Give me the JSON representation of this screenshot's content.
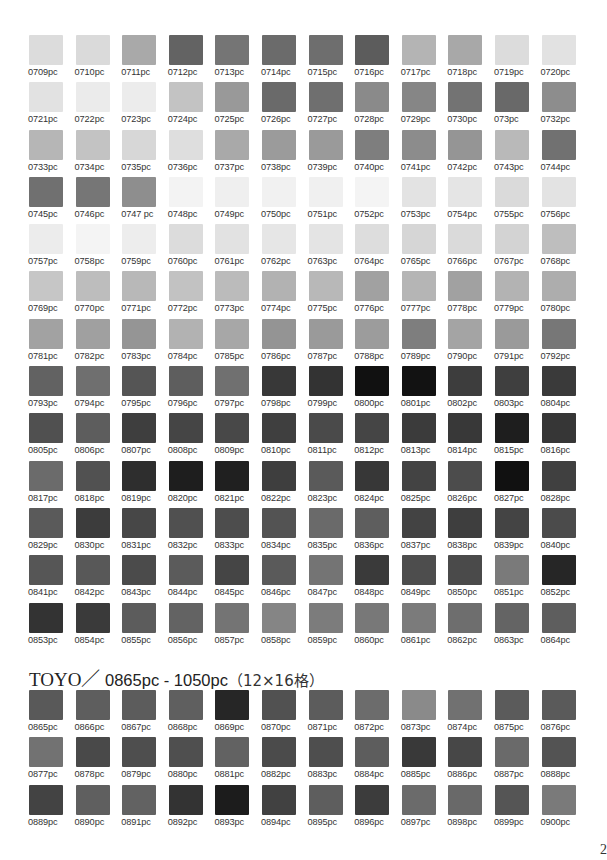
{
  "page": {
    "page_number": "2"
  },
  "section1": {
    "swatches": [
      {
        "code": "0709pc",
        "color": "#dcdcdc"
      },
      {
        "code": "0710pc",
        "color": "#dadada"
      },
      {
        "code": "0711pc",
        "color": "#a9a9a9"
      },
      {
        "code": "0712pc",
        "color": "#636363"
      },
      {
        "code": "0713pc",
        "color": "#757575"
      },
      {
        "code": "0714pc",
        "color": "#6b6b6b"
      },
      {
        "code": "0715pc",
        "color": "#6e6e6e"
      },
      {
        "code": "0716pc",
        "color": "#5c5c5c"
      },
      {
        "code": "0717pc",
        "color": "#b4b4b4"
      },
      {
        "code": "0718pc",
        "color": "#a8a8a8"
      },
      {
        "code": "0719pc",
        "color": "#dcdcdc"
      },
      {
        "code": "0720pc",
        "color": "#e2e2e2"
      },
      {
        "code": "0721pc",
        "color": "#e2e2e2"
      },
      {
        "code": "0722pc",
        "color": "#ebebeb"
      },
      {
        "code": "0723pc",
        "color": "#ececec"
      },
      {
        "code": "0724pc",
        "color": "#c3c3c3"
      },
      {
        "code": "0725pc",
        "color": "#999999"
      },
      {
        "code": "0726pc",
        "color": "#6a6a6a"
      },
      {
        "code": "0727pc",
        "color": "#6f6f6f"
      },
      {
        "code": "0728pc",
        "color": "#8a8a8a"
      },
      {
        "code": "0729pc",
        "color": "#868686"
      },
      {
        "code": "0730pc",
        "color": "#737373"
      },
      {
        "code": "073pc",
        "color": "#696969"
      },
      {
        "code": "0732pc",
        "color": "#8d8d8d"
      },
      {
        "code": "0733pc",
        "color": "#b6b6b6"
      },
      {
        "code": "0734pc",
        "color": "#c3c3c3"
      },
      {
        "code": "0735pc",
        "color": "#d7d7d7"
      },
      {
        "code": "0736pc",
        "color": "#dedede"
      },
      {
        "code": "0737pc",
        "color": "#a9a9a9"
      },
      {
        "code": "0738pc",
        "color": "#9b9b9b"
      },
      {
        "code": "0739pc",
        "color": "#9a9a9a"
      },
      {
        "code": "0740pc",
        "color": "#7e7e7e"
      },
      {
        "code": "0741pc",
        "color": "#8c8c8c"
      },
      {
        "code": "0742pc",
        "color": "#959595"
      },
      {
        "code": "0743pc",
        "color": "#b9b9b9"
      },
      {
        "code": "0744pc",
        "color": "#717171"
      },
      {
        "code": "0745pc",
        "color": "#707070"
      },
      {
        "code": "0746pc",
        "color": "#767676"
      },
      {
        "code": "0747 pc",
        "color": "#8e8e8e"
      },
      {
        "code": "0748pc",
        "color": "#f3f3f3"
      },
      {
        "code": "0749pc",
        "color": "#efefef"
      },
      {
        "code": "0750pc",
        "color": "#f1f1f1"
      },
      {
        "code": "0751pc",
        "color": "#f0f0f0"
      },
      {
        "code": "0752pc",
        "color": "#f4f4f4"
      },
      {
        "code": "0753pc",
        "color": "#e3e3e3"
      },
      {
        "code": "0754pc",
        "color": "#e5e5e5"
      },
      {
        "code": "0755pc",
        "color": "#dadada"
      },
      {
        "code": "0756pc",
        "color": "#e3e3e3"
      },
      {
        "code": "0757pc",
        "color": "#ececec"
      },
      {
        "code": "0758pc",
        "color": "#f4f4f4"
      },
      {
        "code": "0759pc",
        "color": "#ededed"
      },
      {
        "code": "0760pc",
        "color": "#dcdcdc"
      },
      {
        "code": "0761pc",
        "color": "#e2e2e2"
      },
      {
        "code": "0762pc",
        "color": "#e6e6e6"
      },
      {
        "code": "0763pc",
        "color": "#e4e4e4"
      },
      {
        "code": "0764pc",
        "color": "#dddddd"
      },
      {
        "code": "0765pc",
        "color": "#d6d6d6"
      },
      {
        "code": "0766pc",
        "color": "#dadada"
      },
      {
        "code": "0767pc",
        "color": "#d3d3d3"
      },
      {
        "code": "0768pc",
        "color": "#bebebe"
      },
      {
        "code": "0769pc",
        "color": "#c6c6c6"
      },
      {
        "code": "0770pc",
        "color": "#bdbdbd"
      },
      {
        "code": "0771pc",
        "color": "#b8b8b8"
      },
      {
        "code": "0772pc",
        "color": "#c2c2c2"
      },
      {
        "code": "0773pc",
        "color": "#bbbbbb"
      },
      {
        "code": "0774pc",
        "color": "#b2b2b2"
      },
      {
        "code": "0775pc",
        "color": "#b8b8b8"
      },
      {
        "code": "0776pc",
        "color": "#a1a1a1"
      },
      {
        "code": "0777pc",
        "color": "#b5b5b5"
      },
      {
        "code": "0778pc",
        "color": "#a1a1a1"
      },
      {
        "code": "0779pc",
        "color": "#b3b3b3"
      },
      {
        "code": "0780pc",
        "color": "#adadad"
      },
      {
        "code": "0781pc",
        "color": "#a2a2a2"
      },
      {
        "code": "0782pc",
        "color": "#a0a0a0"
      },
      {
        "code": "0783pc",
        "color": "#959595"
      },
      {
        "code": "0784pc",
        "color": "#b2b2b2"
      },
      {
        "code": "0785pc",
        "color": "#a7a7a7"
      },
      {
        "code": "0786pc",
        "color": "#949494"
      },
      {
        "code": "0787pc",
        "color": "#9a9a9a"
      },
      {
        "code": "0788pc",
        "color": "#9c9c9c"
      },
      {
        "code": "0789pc",
        "color": "#7e7e7e"
      },
      {
        "code": "0790pc",
        "color": "#a4a4a4"
      },
      {
        "code": "0791pc",
        "color": "#9a9a9a"
      },
      {
        "code": "0792pc",
        "color": "#777777"
      },
      {
        "code": "0793pc",
        "color": "#626262"
      },
      {
        "code": "0794pc",
        "color": "#6f6f6f"
      },
      {
        "code": "0795pc",
        "color": "#555555"
      },
      {
        "code": "0796pc",
        "color": "#5e5e5e"
      },
      {
        "code": "0797pc",
        "color": "#707070"
      },
      {
        "code": "0798pc",
        "color": "#383838"
      },
      {
        "code": "0799pc",
        "color": "#333333"
      },
      {
        "code": "0800pc",
        "color": "#111111"
      },
      {
        "code": "0801pc",
        "color": "#121212"
      },
      {
        "code": "0802pc",
        "color": "#3d3d3d"
      },
      {
        "code": "0803pc",
        "color": "#3f3f3f"
      },
      {
        "code": "0804pc",
        "color": "#3a3a3a"
      },
      {
        "code": "0805pc",
        "color": "#505050"
      },
      {
        "code": "0806pc",
        "color": "#5d5d5d"
      },
      {
        "code": "0807pc",
        "color": "#3e3e3e"
      },
      {
        "code": "0808pc",
        "color": "#454545"
      },
      {
        "code": "0809pc",
        "color": "#484848"
      },
      {
        "code": "0810pc",
        "color": "#3f3f3f"
      },
      {
        "code": "0811pc",
        "color": "#4a4a4a"
      },
      {
        "code": "0812pc",
        "color": "#454545"
      },
      {
        "code": "0813pc",
        "color": "#3b3b3b"
      },
      {
        "code": "0814pc",
        "color": "#383838"
      },
      {
        "code": "0815pc",
        "color": "#1e1e1e"
      },
      {
        "code": "0816pc",
        "color": "#363636"
      },
      {
        "code": "0817pc",
        "color": "#6b6b6b"
      },
      {
        "code": "0818pc",
        "color": "#515151"
      },
      {
        "code": "0819pc",
        "color": "#2e2e2e"
      },
      {
        "code": "0820pc",
        "color": "#1e1e1e"
      },
      {
        "code": "0821pc",
        "color": "#202020"
      },
      {
        "code": "0822pc",
        "color": "#3e3e3e"
      },
      {
        "code": "0823pc",
        "color": "#5a5a5a"
      },
      {
        "code": "0824pc",
        "color": "#373737"
      },
      {
        "code": "0825pc",
        "color": "#434343"
      },
      {
        "code": "0826pc",
        "color": "#4c4c4c"
      },
      {
        "code": "0827pc",
        "color": "#111111"
      },
      {
        "code": "0828pc",
        "color": "#404040"
      },
      {
        "code": "0829pc",
        "color": "#5a5a5a"
      },
      {
        "code": "0830pc",
        "color": "#3c3c3c"
      },
      {
        "code": "0831pc",
        "color": "#474747"
      },
      {
        "code": "0832pc",
        "color": "#505050"
      },
      {
        "code": "0833pc",
        "color": "#4d4d4d"
      },
      {
        "code": "0834pc",
        "color": "#535353"
      },
      {
        "code": "0835pc",
        "color": "#6a6a6a"
      },
      {
        "code": "0836pc",
        "color": "#5e5e5e"
      },
      {
        "code": "0837pc",
        "color": "#434343"
      },
      {
        "code": "0838pc",
        "color": "#3e3e3e"
      },
      {
        "code": "0839pc",
        "color": "#444444"
      },
      {
        "code": "0840pc",
        "color": "#4b4b4b"
      },
      {
        "code": "0841pc",
        "color": "#565656"
      },
      {
        "code": "0842pc",
        "color": "#585858"
      },
      {
        "code": "0843pc",
        "color": "#4b4b4b"
      },
      {
        "code": "0844pc",
        "color": "#5b5b5b"
      },
      {
        "code": "0845pc",
        "color": "#454545"
      },
      {
        "code": "0846pc",
        "color": "#5a5a5a"
      },
      {
        "code": "0847pc",
        "color": "#747474"
      },
      {
        "code": "0848pc",
        "color": "#3a3a3a"
      },
      {
        "code": "0849pc",
        "color": "#4d4d4d"
      },
      {
        "code": "0850pc",
        "color": "#4a4a4a"
      },
      {
        "code": "0851pc",
        "color": "#7a7a7a"
      },
      {
        "code": "0852pc",
        "color": "#262626"
      },
      {
        "code": "0853pc",
        "color": "#333333"
      },
      {
        "code": "0854pc",
        "color": "#3a3a3a"
      },
      {
        "code": "0855pc",
        "color": "#5c5c5c"
      },
      {
        "code": "0856pc",
        "color": "#636363"
      },
      {
        "code": "0857pc",
        "color": "#747474"
      },
      {
        "code": "0858pc",
        "color": "#858585"
      },
      {
        "code": "0859pc",
        "color": "#7c7c7c"
      },
      {
        "code": "0860pc",
        "color": "#787878"
      },
      {
        "code": "0861pc",
        "color": "#7b7b7b"
      },
      {
        "code": "0862pc",
        "color": "#6e6e6e"
      },
      {
        "code": "0863pc",
        "color": "#646464"
      },
      {
        "code": "0864pc",
        "color": "#5e5e5e"
      }
    ]
  },
  "section2": {
    "title_brand": "TOYO／",
    "title_range": " 0865pc - 1050pc",
    "title_dims": "（12×16格）",
    "swatches": [
      {
        "code": "0865pc",
        "color": "#595959"
      },
      {
        "code": "0866pc",
        "color": "#5e5e5e"
      },
      {
        "code": "0867pc",
        "color": "#5c5c5c"
      },
      {
        "code": "0868pc",
        "color": "#5f5f5f"
      },
      {
        "code": "0869pc",
        "color": "#262626"
      },
      {
        "code": "0870pc",
        "color": "#515151"
      },
      {
        "code": "0871pc",
        "color": "#5c5c5c"
      },
      {
        "code": "0872pc",
        "color": "#6c6c6c"
      },
      {
        "code": "0873pc",
        "color": "#8a8a8a"
      },
      {
        "code": "0874pc",
        "color": "#717171"
      },
      {
        "code": "0875pc",
        "color": "#5b5b5b"
      },
      {
        "code": "0876pc",
        "color": "#5a5a5a"
      },
      {
        "code": "0877pc",
        "color": "#727272"
      },
      {
        "code": "0878pc",
        "color": "#494949"
      },
      {
        "code": "0879pc",
        "color": "#4e4e4e"
      },
      {
        "code": "0880pc",
        "color": "#4f4f4f"
      },
      {
        "code": "0881pc",
        "color": "#626262"
      },
      {
        "code": "0882pc",
        "color": "#4b4b4b"
      },
      {
        "code": "0883pc",
        "color": "#4e4e4e"
      },
      {
        "code": "0884pc",
        "color": "#5d5d5d"
      },
      {
        "code": "0885pc",
        "color": "#393939"
      },
      {
        "code": "0886pc",
        "color": "#474747"
      },
      {
        "code": "0887pc",
        "color": "#6a6a6a"
      },
      {
        "code": "0888pc",
        "color": "#535353"
      },
      {
        "code": "0889pc",
        "color": "#434343"
      },
      {
        "code": "0890pc",
        "color": "#5f5f5f"
      },
      {
        "code": "0891pc",
        "color": "#626262"
      },
      {
        "code": "0892pc",
        "color": "#333333"
      },
      {
        "code": "0893pc",
        "color": "#1c1c1c"
      },
      {
        "code": "0894pc",
        "color": "#414141"
      },
      {
        "code": "0895pc",
        "color": "#5e5e5e"
      },
      {
        "code": "0896pc",
        "color": "#3c3c3c"
      },
      {
        "code": "0897pc",
        "color": "#6b6b6b"
      },
      {
        "code": "0898pc",
        "color": "#696969"
      },
      {
        "code": "0899pc",
        "color": "#555555"
      },
      {
        "code": "0900pc",
        "color": "#7a7a7a"
      }
    ]
  }
}
